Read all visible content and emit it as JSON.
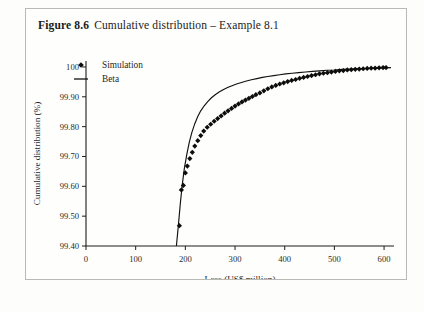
{
  "figure": {
    "number_label": "Figure 8.6",
    "caption": "Cumulative distribution – Example 8.1"
  },
  "colors": {
    "marker": "#0d0d0d",
    "curve": "#111111",
    "axis": "#1c1c1c",
    "border": "#b9b9b6",
    "background": "#fefefc"
  },
  "legend": {
    "position": "top-left-inside",
    "entries": [
      {
        "label": "Simulation",
        "marker": "diamond"
      },
      {
        "label": "Beta",
        "marker": "line"
      }
    ]
  },
  "chart_data": {
    "type": "scatter",
    "title": "Cumulative distribution – Example 8.1",
    "xlabel": "Loss (US$ million)",
    "ylabel": "Cumulative distribution (%)",
    "xlim": [
      0,
      620
    ],
    "ylim": [
      99.4,
      100.02
    ],
    "xticks": [
      0,
      100,
      200,
      300,
      400,
      500,
      600
    ],
    "xtick_labels": [
      "0",
      "100",
      "200",
      "300",
      "400",
      "500",
      "600"
    ],
    "yticks": [
      99.4,
      99.5,
      99.6,
      99.7,
      99.8,
      99.9,
      100
    ],
    "ytick_labels": [
      "99.40",
      "99.50",
      "99.60",
      "99.70",
      "99.80",
      "99.90",
      "100"
    ],
    "grid": false,
    "series": [
      {
        "name": "Simulation",
        "type": "scatter",
        "marker": "diamond",
        "x": [
          188,
          192,
          196,
          200,
          204,
          209,
          214,
          219,
          225,
          231,
          237,
          244,
          251,
          258,
          265,
          272,
          279,
          286,
          293,
          300,
          307,
          314,
          321,
          328,
          335,
          342,
          350,
          358,
          366,
          374,
          382,
          390,
          398,
          406,
          414,
          422,
          430,
          438,
          446,
          454,
          462,
          470,
          478,
          486,
          494,
          502,
          510,
          518,
          526,
          534,
          542,
          550,
          558,
          566,
          574,
          582,
          590,
          598,
          604
        ],
        "y": [
          99.468,
          99.588,
          99.603,
          99.645,
          99.668,
          99.693,
          99.714,
          99.735,
          99.753,
          99.77,
          99.785,
          99.798,
          99.808,
          99.818,
          99.827,
          99.836,
          99.845,
          99.853,
          99.861,
          99.869,
          99.876,
          99.883,
          99.889,
          99.895,
          99.901,
          99.907,
          99.913,
          99.92,
          99.927,
          99.933,
          99.938,
          99.943,
          99.947,
          99.951,
          99.955,
          99.958,
          99.962,
          99.965,
          99.968,
          99.971,
          99.974,
          99.977,
          99.979,
          99.981,
          99.983,
          99.985,
          99.987,
          99.988,
          99.99,
          99.991,
          99.992,
          99.993,
          99.994,
          99.995,
          99.996,
          99.996,
          99.997,
          99.998,
          99.998
        ]
      },
      {
        "name": "Beta",
        "type": "line",
        "x": [
          182,
          186,
          190,
          194,
          198,
          203,
          208,
          213,
          219,
          225,
          231,
          238,
          245,
          252,
          260,
          268,
          276,
          285,
          294,
          303,
          313,
          323,
          333,
          344,
          355,
          366,
          378,
          390,
          402,
          415,
          428,
          442,
          456,
          470,
          485,
          500,
          516,
          532,
          548,
          565,
          582,
          600,
          614
        ],
        "y": [
          99.4,
          99.47,
          99.545,
          99.608,
          99.66,
          99.708,
          99.748,
          99.78,
          99.81,
          99.834,
          99.853,
          99.87,
          99.884,
          99.896,
          99.907,
          99.916,
          99.924,
          99.931,
          99.937,
          99.943,
          99.948,
          99.953,
          99.957,
          99.961,
          99.965,
          99.968,
          99.971,
          99.974,
          99.977,
          99.979,
          99.981,
          99.983,
          99.985,
          99.987,
          99.989,
          99.99,
          99.992,
          99.993,
          99.994,
          99.995,
          99.996,
          99.997,
          99.998
        ]
      }
    ]
  }
}
